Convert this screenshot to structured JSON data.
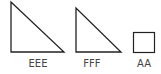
{
  "shapes": [
    {
      "type": "right-triangle",
      "label": "EEE"
    },
    {
      "type": "right-triangle",
      "label": "FFF"
    },
    {
      "type": "square",
      "label": "AA"
    }
  ],
  "colors": {
    "stroke": "#222222",
    "label": "#444444"
  }
}
